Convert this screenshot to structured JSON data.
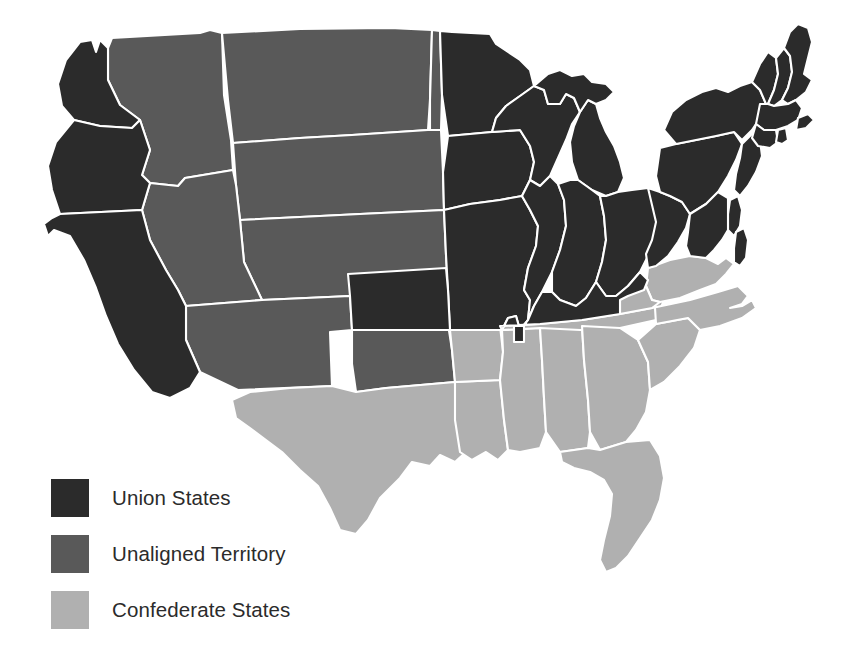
{
  "colors": {
    "union": "#2b2b2b",
    "unaligned": "#595959",
    "confederate": "#b0b0b0",
    "border": "#ffffff",
    "background": "#ffffff",
    "legend_text": "#2b2b2b"
  },
  "legend": {
    "items": [
      {
        "label": "Union States",
        "color": "#2b2b2b",
        "key": "union"
      },
      {
        "label": "Unaligned Territory",
        "color": "#595959",
        "key": "unaligned"
      },
      {
        "label": "Confederate States",
        "color": "#b0b0b0",
        "key": "confederate"
      }
    ]
  },
  "map_data": {
    "type": "choropleth",
    "regions": [
      {
        "name": "Washington",
        "category": "union"
      },
      {
        "name": "Oregon",
        "category": "union"
      },
      {
        "name": "California",
        "category": "union"
      },
      {
        "name": "Kansas",
        "category": "union"
      },
      {
        "name": "Minnesota",
        "category": "union"
      },
      {
        "name": "Iowa",
        "category": "union"
      },
      {
        "name": "Missouri",
        "category": "union"
      },
      {
        "name": "Wisconsin",
        "category": "union"
      },
      {
        "name": "Illinois",
        "category": "union"
      },
      {
        "name": "Michigan",
        "category": "union"
      },
      {
        "name": "Indiana",
        "category": "union"
      },
      {
        "name": "Ohio",
        "category": "union"
      },
      {
        "name": "Kentucky",
        "category": "union"
      },
      {
        "name": "West Virginia",
        "category": "union"
      },
      {
        "name": "Pennsylvania",
        "category": "union"
      },
      {
        "name": "New York",
        "category": "union"
      },
      {
        "name": "New Jersey",
        "category": "union"
      },
      {
        "name": "Delaware",
        "category": "union"
      },
      {
        "name": "Maryland",
        "category": "union"
      },
      {
        "name": "Connecticut",
        "category": "union"
      },
      {
        "name": "Rhode Island",
        "category": "union"
      },
      {
        "name": "Massachusetts",
        "category": "union"
      },
      {
        "name": "Vermont",
        "category": "union"
      },
      {
        "name": "New Hampshire",
        "category": "union"
      },
      {
        "name": "Maine",
        "category": "union"
      },
      {
        "name": "Idaho Territory",
        "category": "unaligned"
      },
      {
        "name": "Montana Territory",
        "category": "unaligned"
      },
      {
        "name": "Dakota Territory",
        "category": "unaligned"
      },
      {
        "name": "Nebraska Territory",
        "category": "unaligned"
      },
      {
        "name": "Nevada Territory",
        "category": "unaligned"
      },
      {
        "name": "Utah Territory",
        "category": "unaligned"
      },
      {
        "name": "Colorado Territory",
        "category": "unaligned"
      },
      {
        "name": "Arizona Territory",
        "category": "unaligned"
      },
      {
        "name": "New Mexico Territory",
        "category": "unaligned"
      },
      {
        "name": "Indian Territory",
        "category": "unaligned"
      },
      {
        "name": "Wyoming Territory",
        "category": "unaligned"
      },
      {
        "name": "Texas",
        "category": "confederate"
      },
      {
        "name": "Arkansas",
        "category": "confederate"
      },
      {
        "name": "Louisiana",
        "category": "confederate"
      },
      {
        "name": "Mississippi",
        "category": "confederate"
      },
      {
        "name": "Alabama",
        "category": "confederate"
      },
      {
        "name": "Tennessee",
        "category": "confederate"
      },
      {
        "name": "Georgia",
        "category": "confederate"
      },
      {
        "name": "Florida",
        "category": "confederate"
      },
      {
        "name": "South Carolina",
        "category": "confederate"
      },
      {
        "name": "North Carolina",
        "category": "confederate"
      },
      {
        "name": "Virginia",
        "category": "confederate"
      }
    ],
    "counts": {
      "union": 25,
      "unaligned": 11,
      "confederate": 11
    }
  }
}
